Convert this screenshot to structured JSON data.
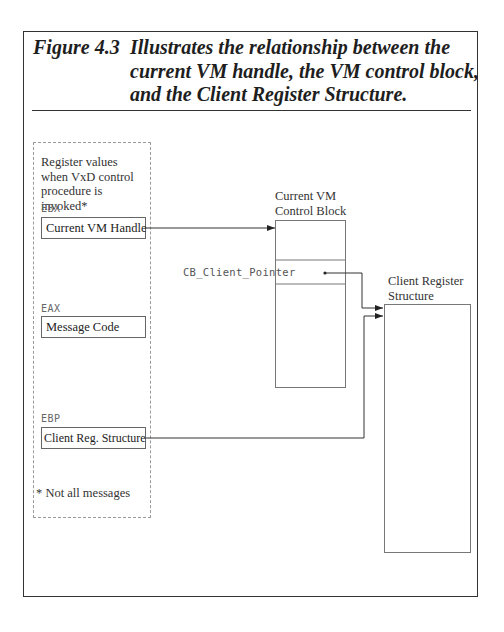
{
  "figure": {
    "number": "Figure 4.3",
    "caption_lines": [
      "Illustrates the relationship between the",
      "current VM handle, the VM control block,",
      "and the Client Register Structure."
    ]
  },
  "register_panel": {
    "intro_lines": [
      "Register values",
      "when VxD control",
      "procedure is invoked*"
    ],
    "registers": [
      {
        "name": "EBX",
        "value": "Current VM Handle"
      },
      {
        "name": "EAX",
        "value": "Message Code"
      },
      {
        "name": "EBP",
        "value": "Client Reg. Structure"
      }
    ],
    "footnote": "* Not all messages"
  },
  "control_block": {
    "label_lines": [
      "Current VM",
      "Control Block"
    ],
    "field_label": "CB_Client_Pointer"
  },
  "client_register_structure": {
    "label_lines": [
      "Client Register",
      "Structure"
    ]
  },
  "connections": [
    {
      "from": "EBX.Current VM Handle",
      "to": "Current VM Control Block"
    },
    {
      "from": "CB_Client_Pointer",
      "to": "Client Register Structure"
    },
    {
      "from": "EBP.Client Reg. Structure",
      "to": "Client Register Structure"
    }
  ]
}
